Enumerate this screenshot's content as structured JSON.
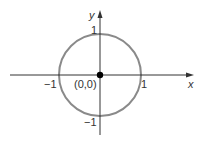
{
  "diagram": {
    "type": "unit-circle",
    "axes": {
      "x_label": "x",
      "y_label": "y"
    },
    "ticks": {
      "x_neg": "−1",
      "x_pos": "1",
      "y_pos": "1",
      "y_neg": "−1"
    },
    "origin_label": "(0,0)",
    "colors": {
      "circle": "#8a8a8a",
      "axes": "#333333",
      "point": "#000000"
    }
  }
}
